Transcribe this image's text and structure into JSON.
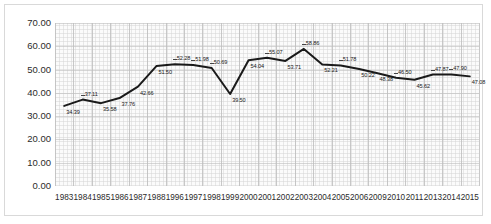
{
  "chart_data": {
    "type": "line",
    "title": "",
    "subtitle": "",
    "xlabel": "",
    "ylabel": "",
    "ylim": [
      0,
      70
    ],
    "ytick_labels": [
      "70.00",
      "60.00",
      "50.00",
      "40.00",
      "30.00",
      "20.00",
      "10.00",
      "0.00"
    ],
    "ytick_values": [
      70,
      60,
      50,
      40,
      30,
      20,
      10,
      0
    ],
    "grid": true,
    "legend": "none",
    "line_color": "#1a1a1a",
    "categories": [
      "1983",
      "1984",
      "1985",
      "1986",
      "1987",
      "1988",
      "1996",
      "1997",
      "1998",
      "1999",
      "2000",
      "2001",
      "2002",
      "2003",
      "2004",
      "2005",
      "2006",
      "2009",
      "2010",
      "2011",
      "2013",
      "2014",
      "2015"
    ],
    "values": [
      34.39,
      37.11,
      35.58,
      37.76,
      42.66,
      51.5,
      52.28,
      51.98,
      50.69,
      39.5,
      54.04,
      55.07,
      53.71,
      58.86,
      52.21,
      51.78,
      50.22,
      48.38,
      46.5,
      45.62,
      47.87,
      47.9,
      47.08
    ],
    "data_labels": [
      "34.39",
      "37.11",
      "35.58",
      "37.76",
      "42.66",
      "51.50",
      "52.28",
      "51.98",
      "50.69",
      "39.50",
      "54.04",
      "55.07",
      "53.71",
      "58.86",
      "52.21",
      "51.78",
      "50.22",
      "48.38",
      "46.50",
      "45.62",
      "47.87",
      "47.90",
      "47.08"
    ]
  },
  "xtick_labels": [
    "1983",
    "1984",
    "1985",
    "1986",
    "1987",
    "1988",
    "1996",
    "1997",
    "1998",
    "1999",
    "2000",
    "2001",
    "2002",
    "2003",
    "2004",
    "2005",
    "2006",
    "2009",
    "2010",
    "2011",
    "2013",
    "2014",
    "2015"
  ]
}
